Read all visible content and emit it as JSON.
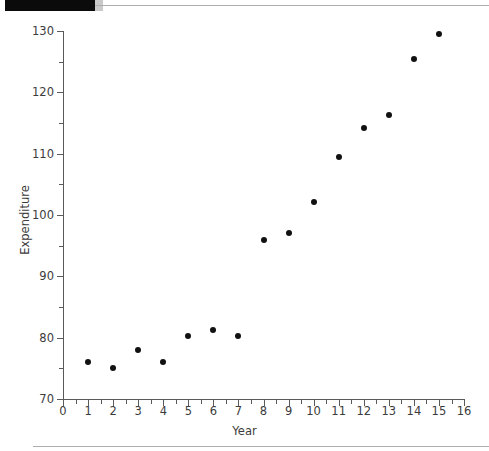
{
  "header": {
    "redaction_bar": "",
    "rule": ""
  },
  "chart_data": {
    "type": "scatter",
    "title": "",
    "xlabel": "Year",
    "ylabel": "Expenditure",
    "x": [
      1,
      2,
      3,
      4,
      5,
      6,
      7,
      8,
      9,
      10,
      11,
      12,
      13,
      14,
      15
    ],
    "values": [
      76.0,
      75.0,
      78.0,
      76.0,
      80.2,
      81.2,
      80.2,
      96.0,
      97.0,
      102.2,
      109.5,
      114.2,
      116.3,
      125.5,
      129.5
    ],
    "series": [
      {
        "name": "Expenditure",
        "values": [
          76.0,
          75.0,
          78.0,
          76.0,
          80.2,
          81.2,
          80.2,
          96.0,
          97.0,
          102.2,
          109.5,
          114.2,
          116.3,
          125.5,
          129.5
        ]
      }
    ],
    "xlim": [
      0,
      16
    ],
    "ylim": [
      70,
      130
    ],
    "x_major_ticks": [
      0,
      1,
      2,
      3,
      4,
      5,
      6,
      7,
      8,
      9,
      10,
      11,
      12,
      13,
      14,
      15,
      16
    ],
    "x_minor_step": 0.5,
    "y_major_ticks": [
      70,
      80,
      90,
      100,
      110,
      120,
      130
    ],
    "y_minor_ticks": [
      75,
      85,
      95,
      105,
      115,
      125
    ],
    "x_tick_labels": [
      "0",
      "1",
      "2",
      "3",
      "4",
      "5",
      "6",
      "7",
      "8",
      "9",
      "10",
      "11",
      "12",
      "13",
      "14",
      "15",
      "16"
    ],
    "y_tick_labels": [
      "70",
      "80",
      "90",
      "100",
      "110",
      "120",
      "130"
    ],
    "grid": false,
    "legend": null,
    "marker": "filled-circle",
    "marker_color": "#111111",
    "axis_color": "#5a5a5a",
    "text_color": "#3c3c3c"
  }
}
